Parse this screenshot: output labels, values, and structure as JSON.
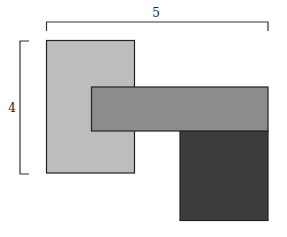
{
  "diagram": {
    "width_label": "5",
    "height_label": "4",
    "shapes": [
      {
        "name": "light-rectangle",
        "x": 46.5,
        "y": 40.5,
        "w": 88,
        "h": 132.5,
        "fill": "#bdbdbd"
      },
      {
        "name": "medium-rectangle",
        "x": 91.5,
        "y": 87,
        "w": 176.5,
        "h": 44,
        "fill": "#8c8c8c"
      },
      {
        "name": "dark-rectangle",
        "x": 180,
        "y": 131,
        "w": 88,
        "h": 89.5,
        "fill": "#3c3c3c"
      }
    ],
    "stroke_color": "#222222",
    "bracket_color": "#333333"
  }
}
